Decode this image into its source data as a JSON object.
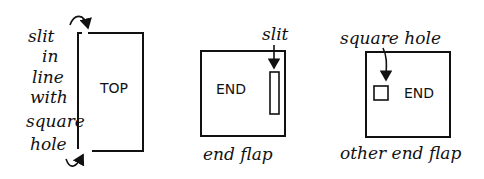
{
  "panels": [
    {
      "name": "top-panel",
      "box_label": "TOP",
      "annotation_lines": [
        "slit",
        "in",
        "line",
        "with",
        "square",
        "hole"
      ]
    },
    {
      "name": "end-flap-panel",
      "box_label": "END",
      "callout": "slit",
      "caption": "end flap"
    },
    {
      "name": "other-end-flap-panel",
      "box_label": "END",
      "callout": "square hole",
      "caption": "other end flap"
    }
  ]
}
